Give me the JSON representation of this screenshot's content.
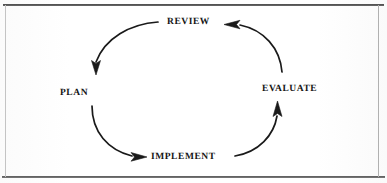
{
  "diagram": {
    "type": "cycle",
    "direction": "clockwise",
    "title": "",
    "background_color": "#ffffff",
    "ink_color": "#151515",
    "frame": {
      "style": "rectangular-rule-border",
      "top_rule_color": "#3a3a3a",
      "bottom_rule_color": "#4a4a4a",
      "side_rule_color": "#bcbcbc"
    },
    "nodes": [
      {
        "id": "review",
        "label": "REVIEW",
        "position": "top"
      },
      {
        "id": "evaluate",
        "label": "EVALUATE",
        "position": "right"
      },
      {
        "id": "implement",
        "label": "IMPLEMENT",
        "position": "bottom"
      },
      {
        "id": "plan",
        "label": "PLAN",
        "position": "left"
      }
    ],
    "edges": [
      {
        "id": "review-to-plan",
        "from": "review",
        "to": "plan",
        "arrowhead": "down",
        "arc": "top-left"
      },
      {
        "id": "plan-to-implement",
        "from": "plan",
        "to": "implement",
        "arrowhead": "right",
        "arc": "bottom-left"
      },
      {
        "id": "implement-to-evaluate",
        "from": "implement",
        "to": "evaluate",
        "arrowhead": "up",
        "arc": "bottom-right"
      },
      {
        "id": "evaluate-to-review",
        "from": "evaluate",
        "to": "review",
        "arrowhead": "left",
        "arc": "top-right"
      }
    ]
  }
}
